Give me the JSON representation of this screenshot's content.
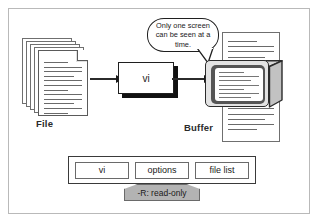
{
  "diagram": {
    "labels": {
      "file": "File",
      "buffer": "Buffer"
    },
    "process_box": {
      "label": "vi"
    },
    "callout": {
      "text": "Only one screen can be seen at a time."
    },
    "command_bar": {
      "items": [
        {
          "label": "vi"
        },
        {
          "label": "options"
        },
        {
          "label": "file list"
        }
      ],
      "option_note": "-R: read-only"
    },
    "flow": [
      {
        "from": "File",
        "to": "vi"
      },
      {
        "from": "vi",
        "to": "Buffer"
      }
    ],
    "colors": {
      "frame": "#b9b9b9",
      "outline": "#1f1f1f",
      "bezel": "#555555",
      "note_fill": "#b3b3b3",
      "paper": "#ffffff"
    }
  }
}
